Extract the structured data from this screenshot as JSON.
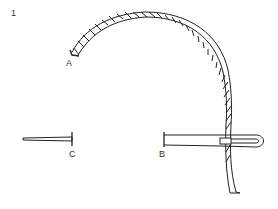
{
  "figure": {
    "number": "1",
    "labels": {
      "a": "A",
      "b": "B",
      "c": "C"
    },
    "parts": [
      {
        "id": "rope",
        "description": "twisted rope/cord"
      },
      {
        "id": "needle-b",
        "description": "needle with eye, rope threaded through"
      },
      {
        "id": "needle-c",
        "description": "pin/needle"
      }
    ],
    "colors": {
      "ink": "#222222",
      "background": "#ffffff"
    }
  }
}
